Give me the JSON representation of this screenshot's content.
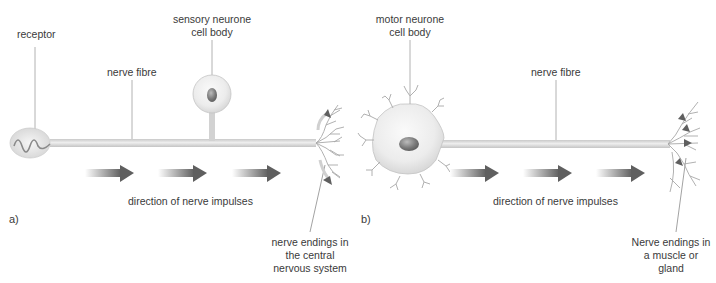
{
  "panels": [
    {
      "id": "a",
      "letter": "a)",
      "title": "sensory neurone",
      "labels": {
        "receptor": "receptor",
        "cell_body_line1": "sensory neurone",
        "cell_body_line2": "cell body",
        "nerve_fibre": "nerve fibre",
        "direction": "direction of nerve impulses",
        "endings_line1": "nerve endings in",
        "endings_line2": "the central",
        "endings_line3": "nervous system"
      },
      "arrow_count": 3
    },
    {
      "id": "b",
      "letter": "b)",
      "title": "motor neurone",
      "labels": {
        "cell_body_line1": "motor neurone",
        "cell_body_line2": "cell body",
        "nerve_fibre": "nerve fibre",
        "direction": "direction of nerve impulses",
        "endings_line1": "Nerve endings in",
        "endings_line2": "a muscle or",
        "endings_line3": "gland"
      },
      "arrow_count": 3
    }
  ],
  "colors": {
    "text": "#3a3a3a",
    "fibre": "#d6d6d6",
    "fibre_edge": "#bdbdbd",
    "cell": "#ececec",
    "nucleus": "#7a7a7a",
    "arrow": "#5f5f5f",
    "leader_line": "#9a9a9a",
    "branch": "#a8a8a8"
  }
}
